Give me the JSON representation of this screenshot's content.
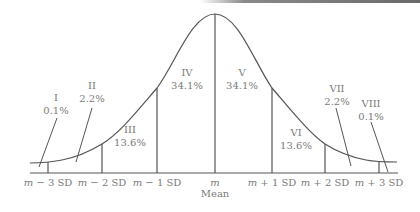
{
  "diagram": {
    "colors": {
      "stroke": "#555555",
      "text": "#7a7a7a",
      "background": "#ffffff"
    },
    "regions": [
      {
        "numeral": "I",
        "percent": "0.1%"
      },
      {
        "numeral": "II",
        "percent": "2.2%"
      },
      {
        "numeral": "III",
        "percent": "13.6%"
      },
      {
        "numeral": "IV",
        "percent": "34.1%"
      },
      {
        "numeral": "V",
        "percent": "34.1%"
      },
      {
        "numeral": "VI",
        "percent": "13.6%"
      },
      {
        "numeral": "VII",
        "percent": "2.2%"
      },
      {
        "numeral": "VIII",
        "percent": "0.1%"
      }
    ],
    "axis_labels": [
      {
        "var": "m",
        "rest": " − 3 SD"
      },
      {
        "var": "m",
        "rest": " − 2 SD"
      },
      {
        "var": "m",
        "rest": " − 1 SD"
      },
      {
        "var": "m",
        "rest": ""
      },
      {
        "var": "m",
        "rest": " + 1 SD"
      },
      {
        "var": "m",
        "rest": " + 2 SD"
      },
      {
        "var": "m",
        "rest": " + 3 SD"
      }
    ],
    "mean_label": "Mean"
  }
}
